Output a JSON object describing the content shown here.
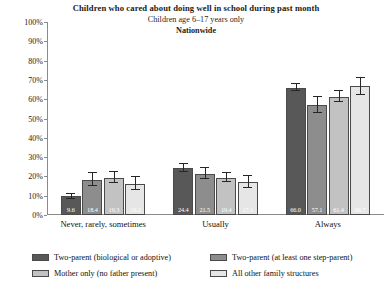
{
  "chart_data": {
    "type": "bar",
    "title": "Children who cared about doing well in school during past month",
    "subtitle": "Children age 6–17 years only",
    "subtitle2": "Nationwide",
    "xlabel": "",
    "ylabel": "",
    "ylim": [
      0,
      100
    ],
    "grid": false,
    "legend_position": "bottom",
    "categories": [
      "Never, rarely, sometimes",
      "Usually",
      "Always"
    ],
    "ytick_labels": [
      "0%",
      "10%",
      "20%",
      "30%",
      "40%",
      "50%",
      "60%",
      "70%",
      "80%",
      "90%",
      "100%"
    ],
    "ytick_values": [
      0,
      10,
      20,
      30,
      40,
      50,
      60,
      70,
      80,
      90,
      100
    ],
    "series": [
      {
        "name": "Two-parent (biological or adoptive)",
        "color": "#585858",
        "values": [
          9.6,
          24.4,
          66.0
        ],
        "labels": [
          "9.6",
          "24.4",
          "66.0"
        ],
        "err_low": [
          1.2,
          2.0,
          2.0
        ],
        "err_high": [
          1.2,
          2.0,
          2.0
        ]
      },
      {
        "name": "Two-parent (at least one step-parent)",
        "color": "#8d8d8d",
        "values": [
          18.4,
          21.5,
          57.1
        ],
        "labels": [
          "18.4",
          "21.5",
          "57.1"
        ],
        "err_low": [
          3.6,
          2.9,
          4.2
        ],
        "err_high": [
          3.6,
          2.9,
          4.2
        ]
      },
      {
        "name": "Mother only (no father present)",
        "color": "#c2c2c2",
        "values": [
          19.3,
          19.4,
          61.4
        ],
        "labels": [
          "19.3",
          "19.4",
          "61.4"
        ],
        "err_low": [
          2.8,
          2.4,
          3.0
        ],
        "err_high": [
          2.8,
          2.4,
          3.0
        ]
      },
      {
        "name": "All other family structures",
        "color": "#e6e6e6",
        "values": [
          16.2,
          17.1,
          66.7
        ],
        "labels": [
          "16.2",
          "17.1",
          "66.7"
        ],
        "err_low": [
          3.4,
          3.2,
          4.4
        ],
        "err_high": [
          3.4,
          3.2,
          4.4
        ]
      }
    ]
  }
}
